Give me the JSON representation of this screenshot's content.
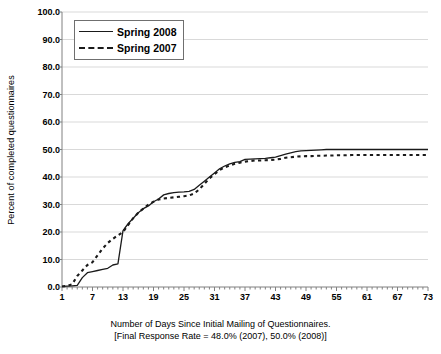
{
  "chart_data": {
    "type": "line",
    "title": "",
    "xlabel": "Number of Days Since Initial Mailing of Questionnaires.",
    "xlabel_line2": "[Final Response Rate = 48.0% (2007), 50.0% (2008)]",
    "ylabel": "Percent of completed questionnaires",
    "xlim": [
      1,
      73
    ],
    "ylim": [
      0,
      100
    ],
    "grid": true,
    "legend_position": "top-left",
    "xticks": [
      1,
      7,
      13,
      19,
      25,
      31,
      37,
      43,
      49,
      55,
      61,
      67,
      73
    ],
    "xtick_labels": [
      "1",
      "7",
      "13",
      "19",
      "25",
      "31",
      "37",
      "43",
      "49",
      "55",
      "61",
      "67",
      "73"
    ],
    "yticks": [
      0,
      10,
      20,
      30,
      40,
      50,
      60,
      70,
      80,
      90,
      100
    ],
    "ytick_labels": [
      "0.0",
      "10.0",
      "20.0",
      "30.0",
      "40.0",
      "50.0",
      "60.0",
      "70.0",
      "80.0",
      "90.0",
      "100.0"
    ],
    "x": [
      1,
      2,
      3,
      4,
      5,
      6,
      7,
      8,
      9,
      10,
      11,
      12,
      13,
      14,
      15,
      16,
      17,
      18,
      19,
      20,
      21,
      22,
      23,
      24,
      25,
      26,
      27,
      28,
      29,
      30,
      31,
      32,
      33,
      34,
      35,
      36,
      37,
      38,
      39,
      40,
      41,
      42,
      43,
      44,
      45,
      46,
      47,
      48,
      49,
      50,
      51,
      52,
      53,
      54,
      55,
      56,
      57,
      58,
      59,
      60,
      61,
      62,
      63,
      64,
      65,
      66,
      67,
      68,
      69,
      70,
      71,
      72,
      73
    ],
    "series": [
      {
        "name": "Spring 2008",
        "style": "solid",
        "color": "#1a1a1a",
        "values": [
          0.2,
          0.3,
          0.4,
          0.6,
          3.4,
          5.2,
          5.6,
          6.0,
          6.4,
          6.8,
          8.0,
          8.4,
          20.5,
          23.0,
          25.0,
          27.0,
          28.5,
          29.5,
          31.0,
          32.0,
          33.5,
          34.0,
          34.3,
          34.5,
          34.6,
          34.8,
          35.5,
          37.0,
          38.5,
          40.0,
          41.5,
          43.0,
          44.0,
          44.8,
          45.3,
          45.6,
          46.4,
          46.5,
          46.6,
          46.7,
          46.8,
          47.0,
          47.2,
          47.8,
          48.3,
          48.8,
          49.2,
          49.5,
          49.6,
          49.7,
          49.8,
          49.9,
          50.0,
          50.0,
          50.0,
          50.0,
          50.0,
          50.0,
          50.0,
          50.0,
          50.0,
          50.0,
          50.0,
          50.0,
          50.0,
          50.0,
          50.0,
          50.0,
          50.0,
          50.0,
          50.0,
          50.0,
          50.0
        ]
      },
      {
        "name": "Spring 2007",
        "style": "dashed",
        "color": "#1a1a1a",
        "values": [
          0.2,
          0.4,
          1.0,
          4.0,
          6.0,
          8.0,
          9.0,
          11.5,
          14.0,
          16.0,
          17.5,
          18.8,
          20.0,
          22.5,
          25.0,
          27.0,
          28.5,
          30.0,
          31.0,
          31.8,
          32.2,
          32.4,
          32.6,
          32.8,
          33.0,
          33.3,
          34.0,
          35.5,
          37.5,
          39.5,
          41.0,
          42.5,
          43.5,
          44.2,
          44.8,
          45.2,
          45.6,
          45.8,
          46.0,
          46.0,
          46.1,
          46.2,
          46.3,
          46.6,
          47.0,
          47.2,
          47.4,
          47.5,
          47.6,
          47.6,
          47.7,
          47.7,
          47.8,
          47.8,
          47.9,
          47.9,
          47.9,
          48.0,
          48.0,
          48.0,
          48.0,
          48.0,
          48.0,
          48.0,
          48.0,
          48.0,
          48.0,
          48.0,
          48.0,
          48.0,
          48.0,
          48.0,
          48.0
        ]
      }
    ],
    "legend": [
      {
        "label": "Spring 2008",
        "style": "solid"
      },
      {
        "label": "Spring 2007",
        "style": "dashed"
      }
    ]
  },
  "colors": {
    "plot_background": "#ffffff",
    "gridline": "#d9d9d9",
    "axis": "#808080",
    "series_line": "#1a1a1a",
    "legend_border": "#6f6f6f"
  }
}
